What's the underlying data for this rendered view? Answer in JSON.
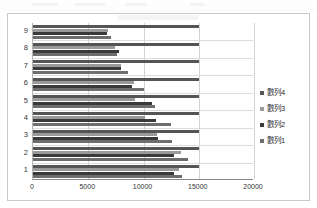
{
  "chart_data": {
    "type": "bar",
    "orientation": "horizontal",
    "title": "",
    "xlabel": "",
    "ylabel": "",
    "categories": [
      "1",
      "2",
      "3",
      "4",
      "5",
      "6",
      "7",
      "8",
      "9"
    ],
    "xlim": [
      0,
      20000
    ],
    "xticks": [
      0,
      5000,
      10000,
      15000,
      20000
    ],
    "xtick_labels": [
      "0",
      "5000",
      "10000",
      "15000",
      "20000"
    ],
    "grid": true,
    "legend_position": "right",
    "series": [
      {
        "name": "數列1",
        "color": "#6e6e6e",
        "values": [
          13500,
          14000,
          12600,
          12500,
          11000,
          10000,
          8600,
          7600,
          7100
        ]
      },
      {
        "name": "數列2",
        "color": "#3a3a3a",
        "values": [
          12800,
          12800,
          11300,
          11100,
          10800,
          9000,
          8000,
          7800,
          6700
        ]
      },
      {
        "name": "數列3",
        "color": "#9a9a9a",
        "values": [
          13200,
          13400,
          11200,
          10100,
          9200,
          9100,
          8000,
          7400,
          6800
        ]
      },
      {
        "name": "數列4",
        "color": "#555555",
        "values": [
          15000,
          15000,
          15000,
          15000,
          15000,
          15000,
          15000,
          15000,
          15000
        ]
      }
    ]
  },
  "legend": {
    "entries": [
      {
        "label": "數列4",
        "color": "#555555"
      },
      {
        "label": "數列3",
        "color": "#9a9a9a"
      },
      {
        "label": "數列2",
        "color": "#3a3a3a"
      },
      {
        "label": "數列1",
        "color": "#6e6e6e"
      }
    ]
  }
}
